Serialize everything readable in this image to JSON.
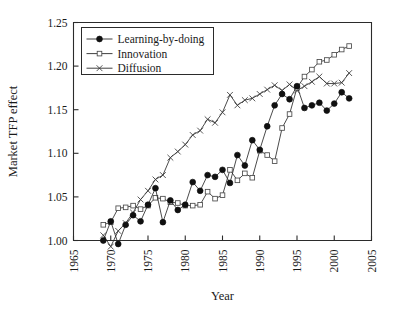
{
  "chart_data": {
    "type": "line",
    "title": "",
    "xlabel": "Year",
    "ylabel": "Market TFP effect",
    "xlim": [
      1965,
      2005
    ],
    "ylim": [
      1.0,
      1.25
    ],
    "xticks": [
      1965,
      1970,
      1975,
      1980,
      1985,
      1990,
      1995,
      2000,
      2005
    ],
    "yticks": [
      1.0,
      1.05,
      1.1,
      1.15,
      1.2,
      1.25
    ],
    "xtick_labels": [
      "1965",
      "1970",
      "1975",
      "1980",
      "1985",
      "1990",
      "1995",
      "2000",
      "2005"
    ],
    "ytick_labels": [
      "1.00",
      "1.05",
      "1.10",
      "1.15",
      "1.20",
      "1.25"
    ],
    "grid": false,
    "legend_position": "upper left",
    "x": [
      1969,
      1970,
      1971,
      1972,
      1973,
      1974,
      1975,
      1976,
      1977,
      1978,
      1979,
      1980,
      1981,
      1982,
      1983,
      1984,
      1985,
      1986,
      1987,
      1988,
      1989,
      1990,
      1991,
      1992,
      1993,
      1994,
      1995,
      1996,
      1997,
      1998,
      1999,
      2000,
      2001,
      2002
    ],
    "series": [
      {
        "name": "Learning-by-doing",
        "marker": "filled-circle",
        "values": [
          1.0,
          1.022,
          0.996,
          1.018,
          1.029,
          1.022,
          1.041,
          1.06,
          1.021,
          1.046,
          1.035,
          1.041,
          1.067,
          1.057,
          1.075,
          1.073,
          1.081,
          1.066,
          1.098,
          1.086,
          1.115,
          1.104,
          1.131,
          1.155,
          1.168,
          1.162,
          1.177,
          1.152,
          1.155,
          1.158,
          1.149,
          1.157,
          1.17,
          1.163
        ]
      },
      {
        "name": "Innovation",
        "marker": "open-square",
        "values": [
          1.018,
          1.021,
          1.037,
          1.038,
          1.04,
          1.036,
          1.04,
          1.049,
          1.048,
          1.044,
          1.043,
          1.04,
          1.04,
          1.041,
          1.056,
          1.048,
          1.052,
          1.081,
          1.069,
          1.077,
          1.072,
          1.103,
          1.098,
          1.091,
          1.129,
          1.145,
          1.175,
          1.188,
          1.196,
          1.205,
          1.207,
          1.213,
          1.219,
          1.223
        ]
      },
      {
        "name": "Diffusion",
        "marker": "cross",
        "values": [
          1.006,
          0.993,
          1.011,
          1.02,
          1.032,
          1.047,
          1.057,
          1.07,
          1.075,
          1.095,
          1.102,
          1.11,
          1.121,
          1.126,
          1.139,
          1.135,
          1.147,
          1.167,
          1.155,
          1.161,
          1.163,
          1.168,
          1.173,
          1.178,
          1.172,
          1.179,
          1.172,
          1.177,
          1.182,
          1.188,
          1.18,
          1.18,
          1.181,
          1.192
        ]
      }
    ],
    "legend": [
      {
        "label": "Learning-by-doing",
        "marker": "filled-circle"
      },
      {
        "label": "Innovation",
        "marker": "open-square"
      },
      {
        "label": "Diffusion",
        "marker": "cross"
      }
    ],
    "colors": {
      "axis": "#2b2b2b",
      "line": "#2b2b2b",
      "marker_filled": "#101010",
      "marker_open_fill": "#ffffff",
      "background": "#ffffff"
    }
  }
}
